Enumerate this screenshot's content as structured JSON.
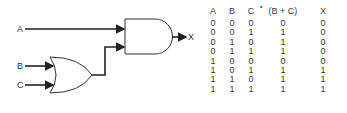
{
  "diagram": {
    "inputs": [
      "A",
      "B",
      "C"
    ],
    "output": "X",
    "gates": [
      {
        "type": "OR",
        "inputs": [
          "B",
          "C"
        ]
      },
      {
        "type": "AND",
        "inputs": [
          "A",
          "OR output"
        ]
      }
    ]
  },
  "truth_table": {
    "headers": [
      "A",
      "B",
      "C",
      "(B + C)",
      "X"
    ],
    "dot_mark": "•",
    "rows": [
      [
        "0",
        "0",
        "0",
        "0",
        "0"
      ],
      [
        "0",
        "0",
        "1",
        "1",
        "0"
      ],
      [
        "0",
        "1",
        "0",
        "1",
        "0"
      ],
      [
        "0",
        "1",
        "1",
        "1",
        "0"
      ],
      [
        "1",
        "0",
        "0",
        "0",
        "0"
      ],
      [
        "1",
        "0",
        "1",
        "1",
        "1"
      ],
      [
        "1",
        "1",
        "0",
        "1",
        "1"
      ],
      [
        "1",
        "1",
        "1",
        "1",
        "1"
      ]
    ]
  }
}
